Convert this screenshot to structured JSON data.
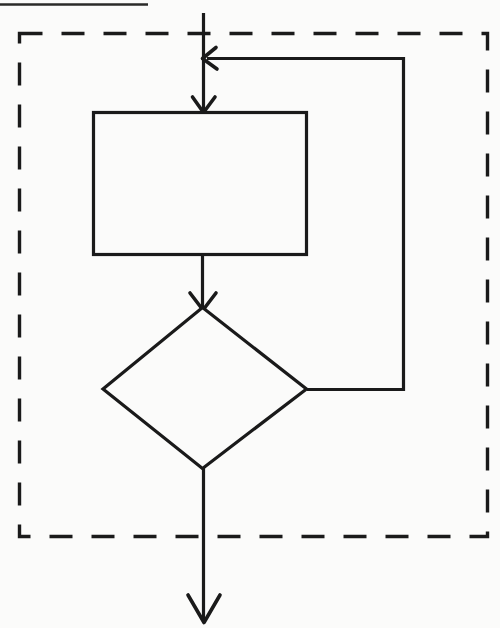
{
  "figure": {
    "background_color": "#fbfbfa",
    "ink_color": "#1a1a1a",
    "width": 500,
    "height": 628
  },
  "page_rule": {
    "name": "top-page-rule",
    "description": "horizontal rule at top of scanned page"
  },
  "boundary": {
    "name": "dashed-loop-boundary",
    "style": "dashed",
    "label": ""
  },
  "nodes": [
    {
      "id": "process",
      "type": "process",
      "shape": "rectangle",
      "label": ""
    },
    {
      "id": "decision",
      "type": "decision",
      "shape": "diamond",
      "label": ""
    }
  ],
  "connectors": [
    {
      "id": "entry",
      "from": "start",
      "to": "process",
      "label": "",
      "arrow": "down"
    },
    {
      "id": "process-to-decision",
      "from": "process",
      "to": "decision",
      "label": "",
      "arrow": "down"
    },
    {
      "id": "feedback",
      "from": "decision",
      "to": "entry",
      "label": "",
      "arrow": "left"
    },
    {
      "id": "exit",
      "from": "decision",
      "to": "end",
      "label": "",
      "arrow": "down"
    }
  ]
}
